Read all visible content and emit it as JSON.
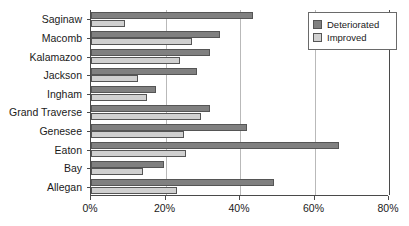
{
  "chart_data": {
    "type": "bar",
    "orientation": "horizontal",
    "title": "",
    "xlabel": "",
    "ylabel": "",
    "xlim": [
      0,
      80
    ],
    "xticks": [
      0,
      20,
      40,
      60,
      80
    ],
    "xtick_labels": [
      "0%",
      "20%",
      "40%",
      "60%",
      "80%"
    ],
    "grid": true,
    "grid_axis": "x",
    "legend_position": "top-right",
    "categories": [
      "Saginaw",
      "Macomb",
      "Kalamazoo",
      "Jackson",
      "Ingham",
      "Grand Traverse",
      "Genesee",
      "Eaton",
      "Bay",
      "Allegan"
    ],
    "series": [
      {
        "name": "Deteriorated",
        "color": "#808080",
        "values": [
          43.5,
          34.5,
          32.0,
          28.5,
          17.5,
          32.0,
          42.0,
          66.5,
          19.5,
          49.0
        ]
      },
      {
        "name": "Improved",
        "color": "#d0d0d0",
        "values": [
          9.0,
          27.0,
          24.0,
          12.5,
          15.0,
          29.5,
          25.0,
          25.5,
          14.0,
          23.0
        ]
      }
    ]
  },
  "legend": {
    "items": [
      {
        "label": "Deteriorated",
        "swatch": "deteriorated"
      },
      {
        "label": "Improved",
        "swatch": "improved"
      }
    ]
  }
}
